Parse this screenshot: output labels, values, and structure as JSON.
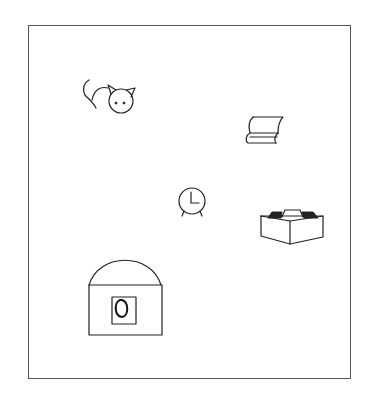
{
  "diagram": {
    "type": "picture-stimulus",
    "frame": {
      "x": 28,
      "y": 25,
      "width": 323,
      "height": 354,
      "border_color": "#555555"
    },
    "stroke_color": "#222222",
    "background": "#ffffff",
    "objects": [
      {
        "id": "cat",
        "label": "cat",
        "center": [
          112,
          100
        ]
      },
      {
        "id": "book",
        "label": "book",
        "center": [
          265,
          130
        ]
      },
      {
        "id": "clock",
        "label": "alarm clock",
        "center": [
          192,
          201
        ]
      },
      {
        "id": "box",
        "label": "open box",
        "center": [
          292,
          227
        ]
      },
      {
        "id": "bag",
        "label": "handbag",
        "center": [
          124,
          305
        ]
      }
    ]
  }
}
